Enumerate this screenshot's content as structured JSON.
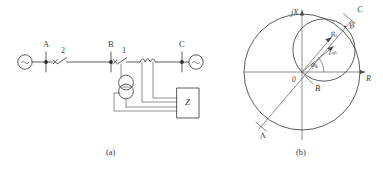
{
  "figure": {
    "caption_a": "(a)",
    "caption_b": "(b)"
  },
  "diagram_a": {
    "title": "single-line protection schematic",
    "terminals": [
      {
        "name": "A",
        "label": "A"
      },
      {
        "name": "B",
        "label": "B"
      },
      {
        "name": "C",
        "label": "C"
      }
    ],
    "breakers": [
      {
        "name": "breaker-2",
        "label": "2"
      },
      {
        "name": "breaker-1",
        "label": "1"
      }
    ],
    "sources": [
      {
        "name": "source-left",
        "symbol": "~"
      },
      {
        "name": "source-right",
        "symbol": "~"
      }
    ],
    "relay": {
      "label": "Z"
    },
    "components": {
      "current_transformer": "current-transformer",
      "reactor": "series-reactor-coil"
    }
  },
  "diagram_b": {
    "title": "impedance plane characteristic",
    "axes": {
      "vertical_label": "jX",
      "horizontal_label": "R",
      "origin_label": "0"
    },
    "points": [
      {
        "name": "point-A",
        "label": "A"
      },
      {
        "name": "point-B",
        "label": "B"
      },
      {
        "name": "point-B-prime",
        "label": "B'"
      },
      {
        "name": "point-C",
        "label": "C"
      }
    ],
    "vectors": [
      {
        "name": "vector-Rt",
        "label": "R",
        "sub": "t"
      },
      {
        "name": "vector-Zm",
        "label": "Z",
        "sub": "m"
      }
    ],
    "angle": {
      "label": "φ",
      "sub": "k"
    },
    "colors": {
      "stroke": "#4a4a4a",
      "accent": "#2b2b2b",
      "background": "#ffffff"
    }
  }
}
